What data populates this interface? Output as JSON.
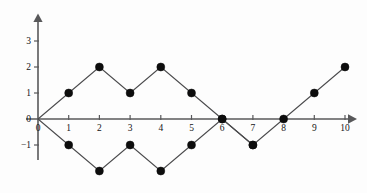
{
  "chart_data": {
    "type": "line",
    "title": "",
    "xlabel": "",
    "ylabel": "",
    "grid": false,
    "legend": "none",
    "xlim": [
      -0.35,
      10.6
    ],
    "ylim": [
      -2.6,
      3.7
    ],
    "xticks": [
      0,
      1,
      2,
      3,
      4,
      5,
      6,
      7,
      8,
      9,
      10
    ],
    "xtick_labels": [
      "0",
      "1",
      "2",
      "3",
      "4",
      "5",
      "6",
      "7",
      "8",
      "9",
      "10"
    ],
    "yticks": [
      -1,
      0,
      1,
      2,
      3
    ],
    "ytick_labels": [
      "−1",
      "0",
      "1",
      "2",
      "3"
    ],
    "marker": "filled-circle",
    "marker_color": "#0d0d0d",
    "line_color": "#4a4a4c",
    "axis_color": "#58585a",
    "background": "#fdfdfd",
    "series": [
      {
        "name": "upper-path",
        "x": [
          0,
          1,
          2,
          3,
          4,
          5,
          6,
          7,
          8,
          9,
          10
        ],
        "values": [
          0,
          1,
          2,
          1,
          2,
          1,
          0,
          -1,
          0,
          1,
          2
        ],
        "markers_at": [
          1,
          2,
          3,
          4,
          5,
          6,
          7,
          8,
          9,
          10
        ]
      },
      {
        "name": "lower-path",
        "x": [
          0,
          1,
          2,
          3,
          4,
          5,
          6,
          7
        ],
        "values": [
          0,
          -1,
          -2,
          -1,
          -2,
          -1,
          0,
          -1
        ],
        "markers_at": [
          1,
          2,
          3,
          4,
          5,
          6,
          7
        ]
      }
    ]
  },
  "axes": {
    "x_axis_name": "horizontal-axis",
    "y_axis_name": "vertical-axis",
    "arrow_x": "right",
    "arrow_y": "up"
  }
}
